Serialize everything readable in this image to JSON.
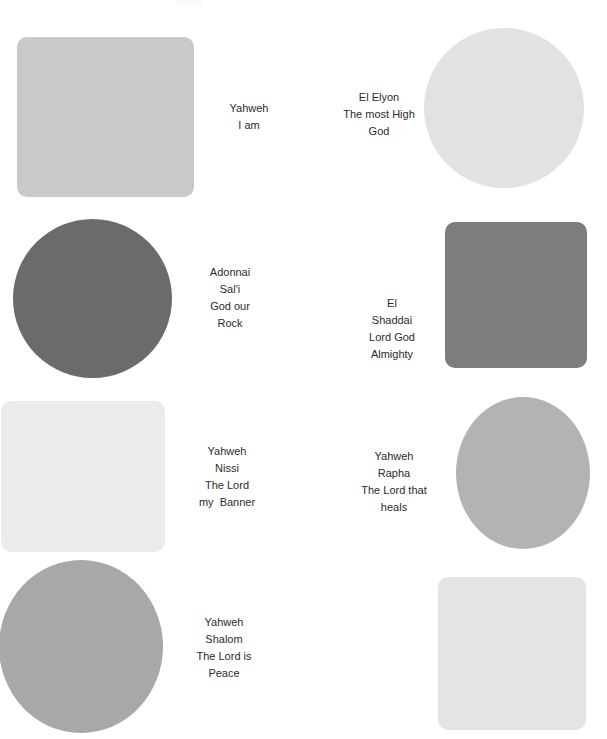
{
  "page": {
    "background_color": "#ffffff",
    "width": 607,
    "height": 739,
    "text_color": "#2b2b2b"
  },
  "items": [
    {
      "id": "yahweh",
      "shape": "rounded-square",
      "color": "#c9c9c9",
      "shape_x": 17,
      "shape_y": 37,
      "shape_w": 177,
      "shape_h": 160,
      "label_x": 194,
      "label_y": 100,
      "label_w": 110,
      "lines": [
        "Yahweh",
        "I am"
      ]
    },
    {
      "id": "el-elyon",
      "shape": "circle",
      "color": "#e2e2e2",
      "shape_x": 424,
      "shape_y": 28,
      "shape_w": 160,
      "shape_h": 160,
      "label_x": 329,
      "label_y": 89,
      "label_w": 100,
      "lines": [
        "El Elyon",
        "The most High",
        "God"
      ]
    },
    {
      "id": "adonnai-sali",
      "shape": "circle",
      "color": "#6b6b6b",
      "shape_x": 13,
      "shape_y": 219,
      "shape_w": 159,
      "shape_h": 159,
      "label_x": 175,
      "label_y": 264,
      "label_w": 110,
      "lines": [
        "Adonnai",
        "Sal'i",
        "God our",
        "Rock"
      ]
    },
    {
      "id": "el-shaddai",
      "shape": "rounded-square",
      "color": "#7d7d7d",
      "shape_x": 445,
      "shape_y": 222,
      "shape_w": 142,
      "shape_h": 146,
      "label_x": 340,
      "label_y": 295,
      "label_w": 104,
      "lines": [
        "El",
        "Shaddai",
        "Lord God",
        "Almighty"
      ]
    },
    {
      "id": "yahweh-nissi",
      "shape": "rounded-square",
      "color": "#ebebeb",
      "shape_x": 1,
      "shape_y": 401,
      "shape_w": 164,
      "shape_h": 151,
      "label_x": 168,
      "label_y": 443,
      "label_w": 118,
      "lines": [
        "Yahweh",
        "Nissi",
        "The Lord",
        "my  Banner"
      ]
    },
    {
      "id": "yahweh-rapha",
      "shape": "circle",
      "color": "#b3b3b3",
      "shape_x": 456,
      "shape_y": 397,
      "shape_w": 134,
      "shape_h": 152,
      "label_x": 339,
      "label_y": 448,
      "label_w": 110,
      "lines": [
        "Yahweh",
        "Rapha",
        "The Lord that",
        "heals"
      ]
    },
    {
      "id": "yahweh-shalom",
      "shape": "circle",
      "color": "#a8a8a8",
      "shape_x": -1,
      "shape_y": 560,
      "shape_w": 164,
      "shape_h": 173,
      "label_x": 166,
      "label_y": 614,
      "label_w": 116,
      "lines": [
        "Yahweh",
        "Shalom",
        "The Lord is",
        "Peace"
      ]
    },
    {
      "id": "unnamed-square",
      "shape": "rounded-square",
      "color": "#e4e4e4",
      "shape_x": 438,
      "shape_y": 577,
      "shape_w": 148,
      "shape_h": 153,
      "label_x": 0,
      "label_y": 0,
      "label_w": 0,
      "lines": []
    }
  ]
}
